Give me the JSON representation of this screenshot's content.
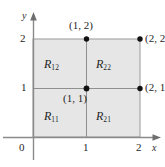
{
  "figure": {
    "type": "math-grid-diagram",
    "background_color": "#ffffff",
    "shaded_fill_color": "#e6e6e6",
    "line_color": "#8a8a8a",
    "axis_color": "#7d7d7d",
    "text_color": "#1f1f1f",
    "dot_color": "#111111"
  },
  "axes": {
    "x": {
      "name": "x",
      "ticks": [
        "1",
        "2"
      ],
      "origin_label": "0"
    },
    "y": {
      "name": "y",
      "ticks": [
        "1",
        "2"
      ]
    }
  },
  "regions": [
    {
      "id": "R12",
      "base": "R",
      "subscript": "12",
      "position": "top-left"
    },
    {
      "id": "R22",
      "base": "R",
      "subscript": "22",
      "position": "top-right"
    },
    {
      "id": "R11",
      "base": "R",
      "subscript": "11",
      "position": "bottom-left"
    },
    {
      "id": "R21",
      "base": "R",
      "subscript": "21",
      "position": "bottom-right"
    }
  ],
  "points": [
    {
      "id": "p12",
      "label": "(1, 2)",
      "x": 1,
      "y": 2
    },
    {
      "id": "p22",
      "label": "(2, 2)",
      "x": 2,
      "y": 2
    },
    {
      "id": "p11",
      "label": "(1, 1)",
      "x": 1,
      "y": 1
    },
    {
      "id": "p21",
      "label": "(2, 1)",
      "x": 2,
      "y": 1
    }
  ]
}
